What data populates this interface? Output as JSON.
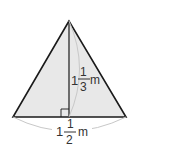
{
  "diagram": {
    "shape": "triangle",
    "fill_color": "#e8e8e8",
    "stroke_color": "#1a1a1a",
    "arc_color": "#c8c8c8",
    "height_label": {
      "whole": "1",
      "numerator": "1",
      "denominator": "3",
      "unit": "m"
    },
    "base_label": {
      "whole": "1",
      "numerator": "1",
      "denominator": "2",
      "unit": "m"
    },
    "right_angle_marker": true
  }
}
